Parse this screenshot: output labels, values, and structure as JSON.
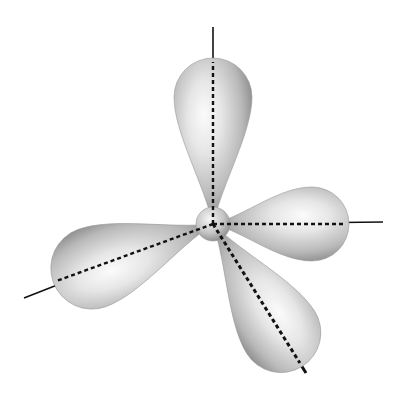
{
  "diagram": {
    "title": "Trigonal pyramidal orbital arrangement (three lobes, one back lobe)",
    "center": {
      "x": 213,
      "y": 224,
      "sphere_radius": 17
    },
    "colors": {
      "background": "#ffffff",
      "lobe_light": "#f4f4f4",
      "lobe_mid": "#c8c8c8",
      "lobe_dark": "#8a8a8a",
      "axis": "#111111"
    },
    "lobes": [
      {
        "name": "top",
        "angle_deg": -90,
        "length": 166,
        "width": 78
      },
      {
        "name": "right",
        "angle_deg": 0,
        "length": 136,
        "width": 74
      },
      {
        "name": "left",
        "angle_deg": 160,
        "length": 170,
        "width": 82
      },
      {
        "name": "lower-right",
        "angle_deg": 58,
        "length": 168,
        "width": 80
      }
    ],
    "axes": [
      {
        "name": "top-axis",
        "x2": 213,
        "y2": 27
      },
      {
        "name": "right-axis",
        "x2": 383,
        "y2": 222
      },
      {
        "name": "left-axis",
        "x2": 24,
        "y2": 298
      },
      {
        "name": "lower-right-axis",
        "x2": 306,
        "y2": 373
      }
    ]
  }
}
